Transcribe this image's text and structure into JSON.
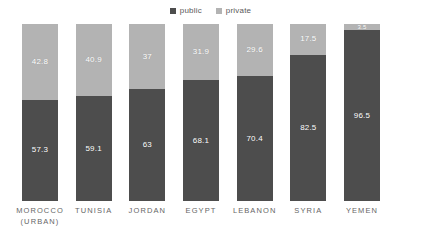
{
  "chart_data": {
    "type": "bar",
    "stacked": true,
    "normalized_percent": true,
    "orientation": "vertical",
    "title": "",
    "subtitle": "",
    "xlabel": "",
    "ylabel": "",
    "ylim": [
      0,
      100
    ],
    "grid": false,
    "legend_position": "top-center",
    "categories": [
      "MOROCCO (URBAN)",
      "TUNISIA",
      "JORDAN",
      "EGYPT",
      "LEBANON",
      "SYRIA",
      "YEMEN"
    ],
    "category_lines": [
      [
        "MOROCCO",
        "(URBAN)"
      ],
      [
        "TUNISIA"
      ],
      [
        "JORDAN"
      ],
      [
        "EGYPT"
      ],
      [
        "LEBANON"
      ],
      [
        "SYRIA"
      ],
      [
        "YEMEN"
      ]
    ],
    "series": [
      {
        "name": "private",
        "color": "#b3b3b3",
        "values": [
          42.8,
          40.9,
          37,
          31.9,
          29.6,
          17.5,
          3.5
        ],
        "labels": [
          "42.8",
          "40.9",
          "37",
          "31.9",
          "29.6",
          "17.5",
          "3.5"
        ]
      },
      {
        "name": "public",
        "color": "#4d4d4d",
        "values": [
          57.3,
          59.1,
          63,
          68.1,
          70.4,
          82.5,
          96.5
        ],
        "labels": [
          "57.3",
          "59.1",
          "63",
          "68.1",
          "70.4",
          "82.5",
          "96.5"
        ]
      }
    ],
    "stack_order_top_to_bottom": [
      "private",
      "public"
    ]
  },
  "legend": {
    "items": [
      {
        "label": "public",
        "color": "#4d4d4d",
        "marker": "square-marker"
      },
      {
        "label": "private",
        "color": "#b3b3b3",
        "marker": "square-marker"
      }
    ]
  },
  "colors": {
    "public": "#4d4d4d",
    "private": "#b3b3b3",
    "background": "#ffffff",
    "label_text": "#ffffff",
    "axis_text": "#666666",
    "legend_text": "#595959"
  }
}
